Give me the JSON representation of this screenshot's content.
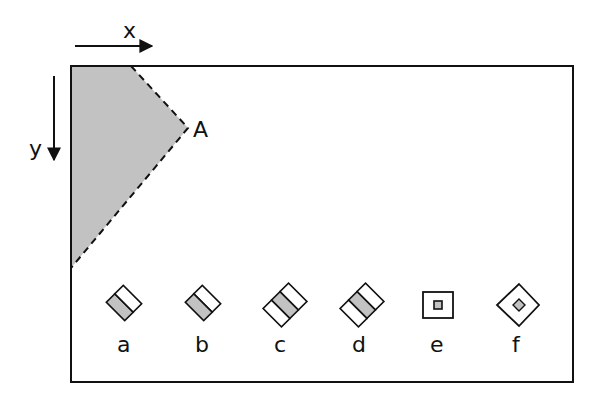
{
  "diagram": {
    "axes": {
      "x_label": "x",
      "y_label": "y"
    },
    "region": {
      "label": "A",
      "fill": "#c0c0c0",
      "border": "dashed"
    },
    "shapes": [
      {
        "label": "a",
        "description": "rotated 2-cell rectangle, upper-left cell shaded"
      },
      {
        "label": "b",
        "description": "rotated 2-cell rectangle, lower-left cell shaded"
      },
      {
        "label": "c",
        "description": "rotated 3-cell rectangle, middle cell shaded"
      },
      {
        "label": "d",
        "description": "rotated 3-cell rectangle (other orientation), middle cell shaded"
      },
      {
        "label": "e",
        "description": "square with small shaded square in center"
      },
      {
        "label": "f",
        "description": "diamond with small shaded diamond in center"
      }
    ],
    "colors": {
      "stroke": "#111111",
      "shade": "#c0c0c0",
      "background": "#ffffff"
    }
  }
}
